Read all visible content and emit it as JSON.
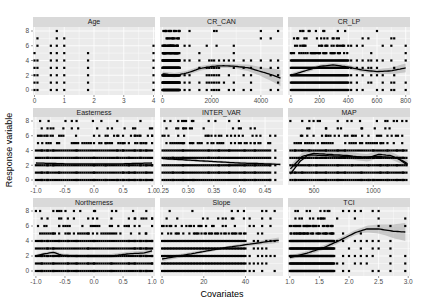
{
  "chart_data": {
    "type": "scatter",
    "title": "",
    "xlabel": "Covariates",
    "ylabel": "Response variable",
    "layout": {
      "rows": 3,
      "cols": 3,
      "facet_type": "facet_wrap",
      "scales": "free_x"
    },
    "ylim": [
      0,
      8
    ],
    "yticks": [
      0,
      2,
      4,
      6,
      8
    ],
    "grid": true,
    "colors": {
      "panel_bg": "#ebebeb",
      "strip_bg": "#d9d9d9",
      "grid": "#ffffff",
      "points": "#000000",
      "smooth": "#000000",
      "ribbon": "#999999"
    },
    "panels": [
      {
        "name": "Age",
        "xlim": [
          -0.05,
          4.05
        ],
        "xticks": [
          0,
          1,
          2,
          3,
          4
        ],
        "points_cols": [
          [
            0.0,
            [
              0,
              1,
              2,
              3,
              4,
              5
            ]
          ],
          [
            0.1,
            [
              0,
              1,
              2,
              3,
              4,
              6,
              7
            ]
          ],
          [
            0.55,
            [
              0,
              1,
              2,
              3,
              4,
              5,
              6
            ]
          ],
          [
            0.75,
            [
              0,
              1,
              2,
              3,
              4,
              5,
              6,
              7,
              8
            ]
          ],
          [
            1.0,
            [
              0,
              1,
              2,
              3,
              4,
              5,
              6,
              7
            ]
          ],
          [
            1.8,
            [
              0,
              1,
              2,
              3,
              4,
              5
            ]
          ],
          [
            4.0,
            [
              0,
              1,
              2,
              3,
              4,
              5,
              6
            ]
          ]
        ],
        "smooth": null
      },
      {
        "name": "CR_CAN",
        "xlim": [
          -100,
          4900
        ],
        "xticks": [
          0,
          2000,
          4000
        ],
        "xtick_labels": [
          "0",
          "2000",
          "4000"
        ],
        "dense_range": [
          0,
          700
        ],
        "sparse_xs": [
          900,
          1100,
          1500,
          1800,
          1900,
          2000,
          2100,
          2200,
          2300,
          2500,
          2700,
          2900,
          3300,
          3600,
          4000,
          4400,
          4700
        ],
        "smooth": [
          [
            0,
            2.2
          ],
          [
            500,
            2.0
          ],
          [
            1000,
            2.3
          ],
          [
            1500,
            2.9
          ],
          [
            2000,
            3.2
          ],
          [
            2500,
            3.3
          ],
          [
            3000,
            3.2
          ],
          [
            3500,
            3.0
          ],
          [
            4000,
            2.5
          ],
          [
            4500,
            2.0
          ],
          [
            4800,
            1.6
          ]
        ],
        "ribbon_halfwidth": [
          [
            0,
            0.3
          ],
          [
            3000,
            0.3
          ],
          [
            4000,
            0.6
          ],
          [
            4800,
            1.1
          ]
        ]
      },
      {
        "name": "CR_LP",
        "xlim": [
          -20,
          830
        ],
        "xticks": [
          0,
          200,
          400,
          600,
          800
        ],
        "xtick_labels": [
          "0",
          "200",
          "400",
          "600",
          "800"
        ],
        "dense_range": [
          0,
          400
        ],
        "sparse_xs": [
          420,
          460,
          500,
          540,
          560,
          600,
          640,
          700,
          720,
          800
        ],
        "smooth": [
          [
            0,
            2.0
          ],
          [
            100,
            2.6
          ],
          [
            200,
            3.2
          ],
          [
            300,
            3.4
          ],
          [
            400,
            3.1
          ],
          [
            500,
            2.7
          ],
          [
            600,
            2.5
          ],
          [
            700,
            2.6
          ],
          [
            800,
            3.0
          ]
        ],
        "ribbon_halfwidth": [
          [
            0,
            0.25
          ],
          [
            600,
            0.3
          ],
          [
            800,
            0.6
          ]
        ]
      },
      {
        "name": "Easterness",
        "xlim": [
          -1.05,
          1.05
        ],
        "xticks": [
          -1.0,
          -0.5,
          0.0,
          0.5,
          1.0
        ],
        "xtick_labels": [
          "-1.0",
          "-0.5",
          "0.0",
          "0.5",
          "1.0"
        ],
        "dense_range": [
          -1.0,
          1.0
        ],
        "sparse_xs": [
          -0.9,
          -0.8,
          -0.7,
          -0.6,
          -0.3,
          0.0,
          0.2,
          0.4,
          0.5,
          0.6,
          0.7,
          0.8,
          0.9,
          1.0
        ],
        "smooth": [
          [
            -1.0,
            2.3
          ],
          [
            -0.5,
            2.2
          ],
          [
            0.0,
            2.2
          ],
          [
            0.5,
            2.2
          ],
          [
            1.0,
            2.3
          ]
        ],
        "ribbon_halfwidth": [
          [
            -1.0,
            0.15
          ],
          [
            1.0,
            0.15
          ]
        ]
      },
      {
        "name": "INTER_VAR",
        "xlim": [
          0.245,
          0.485
        ],
        "xticks": [
          0.25,
          0.3,
          0.35,
          0.4,
          0.45
        ],
        "xtick_labels": [
          "0.25",
          "0.30",
          "0.35",
          "0.40",
          "0.45"
        ],
        "dense_range": [
          0.25,
          0.46
        ],
        "sparse_xs": [
          0.27,
          0.29,
          0.31,
          0.34,
          0.36,
          0.38,
          0.41,
          0.43,
          0.46,
          0.47
        ],
        "smooth": [
          [
            0.25,
            2.9
          ],
          [
            0.3,
            2.7
          ],
          [
            0.35,
            2.5
          ],
          [
            0.4,
            2.3
          ],
          [
            0.45,
            2.2
          ],
          [
            0.48,
            2.1
          ]
        ],
        "ribbon_halfwidth": [
          [
            0.25,
            0.15
          ],
          [
            0.48,
            0.2
          ]
        ]
      },
      {
        "name": "MAP",
        "xlim": [
          280,
          1310
        ],
        "xticks": [
          500,
          1000
        ],
        "xtick_labels": [
          "500",
          "1000"
        ],
        "dense_range": [
          300,
          1280
        ],
        "sparse_xs": [
          340,
          400,
          460,
          520,
          600,
          700,
          760,
          820,
          900,
          960,
          1000,
          1060,
          1120,
          1200,
          1250
        ],
        "smooth": [
          [
            300,
            1.5
          ],
          [
            400,
            3.2
          ],
          [
            500,
            3.6
          ],
          [
            600,
            3.5
          ],
          [
            800,
            3.3
          ],
          [
            950,
            3.0
          ],
          [
            1050,
            3.5
          ],
          [
            1150,
            3.3
          ],
          [
            1250,
            2.6
          ],
          [
            1290,
            2.2
          ]
        ],
        "smooth2": [
          [
            300,
            0.8
          ],
          [
            380,
            2.5
          ],
          [
            450,
            3.4
          ],
          [
            600,
            3.3
          ],
          [
            900,
            3.1
          ],
          [
            1050,
            3.2
          ],
          [
            1200,
            3.0
          ],
          [
            1290,
            2.0
          ]
        ],
        "ribbon_halfwidth": [
          [
            300,
            0.5
          ],
          [
            1290,
            0.5
          ]
        ]
      },
      {
        "name": "Northerness",
        "xlim": [
          -1.05,
          1.05
        ],
        "xticks": [
          -1.0,
          -0.5,
          0.0,
          0.5,
          1.0
        ],
        "xtick_labels": [
          "-1.0",
          "-0.5",
          "0.0",
          "0.5",
          "1.0"
        ],
        "dense_range": [
          -1.0,
          1.0
        ],
        "sparse_xs": [
          -0.9,
          -0.8,
          -0.7,
          -0.6,
          -0.45,
          -0.3,
          -0.1,
          0.0,
          0.3,
          0.6,
          0.7,
          0.8,
          0.9,
          1.0
        ],
        "smooth": [
          [
            -1.0,
            2.0
          ],
          [
            -0.85,
            2.3
          ],
          [
            -0.7,
            2.5
          ],
          [
            -0.55,
            2.1
          ],
          [
            -0.3,
            2.0
          ],
          [
            0.0,
            2.0
          ],
          [
            0.3,
            2.0
          ],
          [
            0.6,
            2.3
          ],
          [
            0.85,
            2.4
          ],
          [
            1.0,
            2.7
          ]
        ],
        "ribbon_halfwidth": [
          [
            -1.0,
            0.2
          ],
          [
            1.0,
            0.3
          ]
        ]
      },
      {
        "name": "Slope",
        "xlim": [
          -1,
          58
        ],
        "xticks": [
          0,
          20,
          40
        ],
        "xtick_labels": [
          "0",
          "20",
          "40"
        ],
        "dense_range": [
          0,
          40
        ],
        "sparse_xs": [
          42,
          44,
          46,
          48,
          50,
          52,
          54
        ],
        "smooth": [
          [
            0,
            1.6
          ],
          [
            10,
            2.1
          ],
          [
            20,
            2.6
          ],
          [
            30,
            3.1
          ],
          [
            40,
            3.5
          ],
          [
            50,
            3.9
          ],
          [
            56,
            4.1
          ]
        ],
        "ribbon_halfwidth": [
          [
            0,
            0.3
          ],
          [
            30,
            0.15
          ],
          [
            56,
            0.35
          ]
        ]
      },
      {
        "name": "TCI",
        "xlim": [
          0.97,
          3.03
        ],
        "xticks": [
          1.0,
          1.5,
          2.0,
          2.5,
          3.0
        ],
        "xtick_labels": [
          "1.0",
          "1.5",
          "2.0",
          "2.5",
          "3.0"
        ],
        "dense_range": [
          1.0,
          1.75
        ],
        "sparse_xs": [
          1.8,
          1.9,
          2.0,
          2.1,
          2.2,
          2.3,
          2.4,
          2.5,
          2.7,
          2.95
        ],
        "smooth": [
          [
            1.0,
            1.8
          ],
          [
            1.3,
            2.4
          ],
          [
            1.6,
            3.2
          ],
          [
            1.9,
            4.3
          ],
          [
            2.1,
            5.1
          ],
          [
            2.3,
            5.6
          ],
          [
            2.5,
            5.6
          ],
          [
            2.75,
            5.3
          ],
          [
            2.95,
            5.2
          ]
        ],
        "ribbon_halfwidth": [
          [
            1.0,
            0.25
          ],
          [
            2.2,
            0.35
          ],
          [
            2.6,
            0.7
          ],
          [
            2.95,
            1.2
          ]
        ]
      }
    ]
  }
}
